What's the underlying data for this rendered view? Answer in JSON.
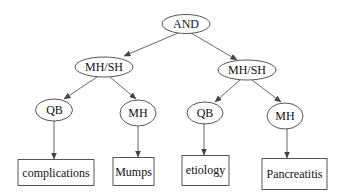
{
  "diagram": {
    "type": "query-tree",
    "stroke_color": "#444444",
    "root": {
      "label": "AND"
    },
    "level1": [
      {
        "label": "MH/SH"
      },
      {
        "label": "MH/SH"
      }
    ],
    "level2": [
      {
        "label": "QB"
      },
      {
        "label": "MH"
      },
      {
        "label": "QB"
      },
      {
        "label": "MH"
      }
    ],
    "leaves": [
      {
        "label": "complications"
      },
      {
        "label": "Mumps"
      },
      {
        "label": "etiology"
      },
      {
        "label": "Pancreatitis"
      }
    ],
    "edges": [
      [
        "AND",
        "MH/SH (left)"
      ],
      [
        "AND",
        "MH/SH (right)"
      ],
      [
        "MH/SH (left)",
        "QB (left)"
      ],
      [
        "MH/SH (left)",
        "MH (left)"
      ],
      [
        "MH/SH (right)",
        "QB (right)"
      ],
      [
        "MH/SH (right)",
        "MH (right)"
      ],
      [
        "QB (left)",
        "complications"
      ],
      [
        "MH (left)",
        "Mumps"
      ],
      [
        "QB (right)",
        "etiology"
      ],
      [
        "MH (right)",
        "Pancreatitis"
      ]
    ]
  }
}
